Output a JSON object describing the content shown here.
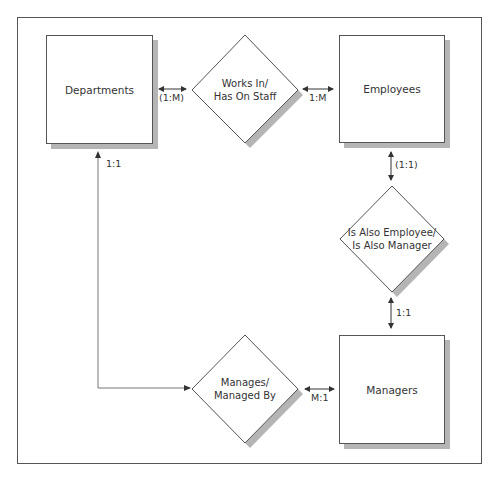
{
  "diagram": {
    "type": "entity-relationship",
    "entities": [
      {
        "id": "departments",
        "label": "Departments"
      },
      {
        "id": "employees",
        "label": "Employees"
      },
      {
        "id": "managers",
        "label": "Managers"
      }
    ],
    "relationships": [
      {
        "id": "works_in",
        "line1": "Works In/",
        "line2": "Has On Staff"
      },
      {
        "id": "is_also",
        "line1": "Is Also Employee/",
        "line2": "Is Also Manager"
      },
      {
        "id": "manages",
        "line1": "Manages/",
        "line2": "Managed By"
      }
    ],
    "cardinalities": {
      "departments_works_in": "(1:M)",
      "works_in_employees": "1:M",
      "employees_is_also": "(1:1)",
      "is_also_managers": "1:1",
      "managers_manages": "M:1",
      "departments_manages": "1:1"
    },
    "colors": {
      "stroke": "#555555",
      "shadow": "#b5b5b5",
      "fill": "#ffffff",
      "connector": "#777777"
    }
  }
}
